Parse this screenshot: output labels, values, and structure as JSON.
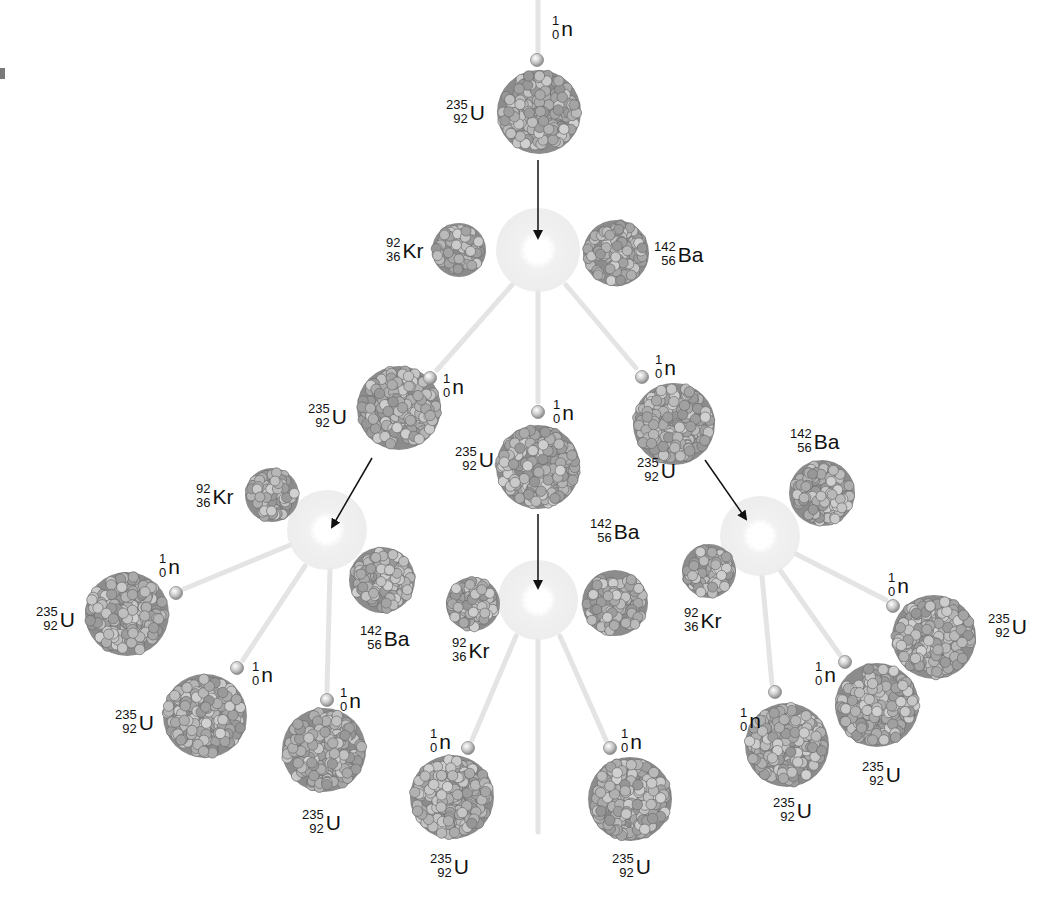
{
  "colors": {
    "background": "#ffffff",
    "nucleus_fill": "#9a9a9a",
    "nucleon_light": "#c8c8c8",
    "nucleon_dark": "#7d7d7d",
    "flash_glow": "#ececec",
    "neutron": "#cfcfcf",
    "arrow": "#111111",
    "trail": "#dcdcdc",
    "label_text": "#111111"
  },
  "species": {
    "U": {
      "symbol": "U",
      "mass": "235",
      "atomic": "92"
    },
    "Kr": {
      "symbol": "Kr",
      "mass": "92",
      "atomic": "36"
    },
    "Ba": {
      "symbol": "Ba",
      "mass": "142",
      "atomic": "56"
    },
    "n": {
      "symbol": "n",
      "mass": "1",
      "atomic": "0"
    }
  },
  "labels": [
    {
      "id": "n-top",
      "symbol": "n",
      "mass": "1",
      "atomic": "0",
      "x": 552,
      "y": 14
    },
    {
      "id": "u-top",
      "symbol": "U",
      "mass": "235",
      "atomic": "92",
      "x": 446,
      "y": 98
    },
    {
      "id": "kr-1",
      "symbol": "Kr",
      "mass": "92",
      "atomic": "36",
      "x": 386,
      "y": 236
    },
    {
      "id": "ba-1",
      "symbol": "Ba",
      "mass": "142",
      "atomic": "56",
      "x": 654,
      "y": 240
    },
    {
      "id": "n-l1",
      "symbol": "n",
      "mass": "1",
      "atomic": "0",
      "x": 443,
      "y": 372
    },
    {
      "id": "u-l1",
      "symbol": "U",
      "mass": "235",
      "atomic": "92",
      "x": 308,
      "y": 402
    },
    {
      "id": "n-c1",
      "symbol": "n",
      "mass": "1",
      "atomic": "0",
      "x": 553,
      "y": 398
    },
    {
      "id": "n-r1",
      "symbol": "n",
      "mass": "1",
      "atomic": "0",
      "x": 655,
      "y": 353
    },
    {
      "id": "u-c1",
      "symbol": "U",
      "mass": "235",
      "atomic": "92",
      "x": 455,
      "y": 445
    },
    {
      "id": "u-r1",
      "symbol": "U",
      "mass": "235",
      "atomic": "92",
      "x": 637,
      "y": 456
    },
    {
      "id": "ba-r2",
      "symbol": "Ba",
      "mass": "142",
      "atomic": "56",
      "x": 790,
      "y": 427
    },
    {
      "id": "kr-l2",
      "symbol": "Kr",
      "mass": "92",
      "atomic": "36",
      "x": 196,
      "y": 482
    },
    {
      "id": "ba-c2",
      "symbol": "Ba",
      "mass": "142",
      "atomic": "56",
      "x": 590,
      "y": 517
    },
    {
      "id": "n-l2a",
      "symbol": "n",
      "mass": "1",
      "atomic": "0",
      "x": 159,
      "y": 552
    },
    {
      "id": "u-l2a",
      "symbol": "U",
      "mass": "235",
      "atomic": "92",
      "x": 36,
      "y": 605
    },
    {
      "id": "n-r2a",
      "symbol": "n",
      "mass": "1",
      "atomic": "0",
      "x": 888,
      "y": 571
    },
    {
      "id": "kr-r2",
      "symbol": "Kr",
      "mass": "92",
      "atomic": "36",
      "x": 684,
      "y": 606
    },
    {
      "id": "u-r2a",
      "symbol": "U",
      "mass": "235",
      "atomic": "92",
      "x": 988,
      "y": 612
    },
    {
      "id": "ba-l2",
      "symbol": "Ba",
      "mass": "142",
      "atomic": "56",
      "x": 360,
      "y": 624
    },
    {
      "id": "kr-c2",
      "symbol": "Kr",
      "mass": "92",
      "atomic": "36",
      "x": 452,
      "y": 636
    },
    {
      "id": "n-l2b",
      "symbol": "n",
      "mass": "1",
      "atomic": "0",
      "x": 252,
      "y": 660
    },
    {
      "id": "n-r2b",
      "symbol": "n",
      "mass": "1",
      "atomic": "0",
      "x": 815,
      "y": 660
    },
    {
      "id": "u-l2b",
      "symbol": "U",
      "mass": "235",
      "atomic": "92",
      "x": 115,
      "y": 708
    },
    {
      "id": "n-l2c",
      "symbol": "n",
      "mass": "1",
      "atomic": "0",
      "x": 340,
      "y": 686
    },
    {
      "id": "n-r2c",
      "symbol": "n",
      "mass": "1",
      "atomic": "0",
      "x": 740,
      "y": 706
    },
    {
      "id": "n-c2a",
      "symbol": "n",
      "mass": "1",
      "atomic": "0",
      "x": 430,
      "y": 727
    },
    {
      "id": "n-c2b",
      "symbol": "n",
      "mass": "1",
      "atomic": "0",
      "x": 621,
      "y": 727
    },
    {
      "id": "u-r2b",
      "symbol": "U",
      "mass": "235",
      "atomic": "92",
      "x": 862,
      "y": 760
    },
    {
      "id": "u-l2c",
      "symbol": "U",
      "mass": "235",
      "atomic": "92",
      "x": 302,
      "y": 808
    },
    {
      "id": "u-r2c",
      "symbol": "U",
      "mass": "235",
      "atomic": "92",
      "x": 773,
      "y": 796
    },
    {
      "id": "u-c2a",
      "symbol": "U",
      "mass": "235",
      "atomic": "92",
      "x": 430,
      "y": 852
    },
    {
      "id": "u-c2b",
      "symbol": "U",
      "mass": "235",
      "atomic": "92",
      "x": 612,
      "y": 852
    }
  ],
  "nuclei": [
    {
      "id": "u-top",
      "species": "U",
      "cx": 539,
      "cy": 112,
      "r": 42
    },
    {
      "id": "kr-1",
      "species": "Kr",
      "cx": 459,
      "cy": 250,
      "r": 27
    },
    {
      "id": "ba-1",
      "species": "Ba",
      "cx": 616,
      "cy": 253,
      "r": 33
    },
    {
      "id": "u-l1",
      "species": "U",
      "cx": 399,
      "cy": 408,
      "r": 42
    },
    {
      "id": "u-c1",
      "species": "U",
      "cx": 538,
      "cy": 467,
      "r": 42
    },
    {
      "id": "u-r1",
      "species": "U",
      "cx": 674,
      "cy": 424,
      "r": 41
    },
    {
      "id": "kr-l2",
      "species": "Kr",
      "cx": 272,
      "cy": 495,
      "r": 27
    },
    {
      "id": "ba-l2",
      "species": "Ba",
      "cx": 382,
      "cy": 580,
      "r": 33
    },
    {
      "id": "u-l2a",
      "species": "U",
      "cx": 127,
      "cy": 614,
      "r": 42
    },
    {
      "id": "u-l2b",
      "species": "U",
      "cx": 205,
      "cy": 716,
      "r": 42
    },
    {
      "id": "u-l2c",
      "species": "U",
      "cx": 324,
      "cy": 750,
      "r": 42
    },
    {
      "id": "kr-c2",
      "species": "Kr",
      "cx": 473,
      "cy": 604,
      "r": 27
    },
    {
      "id": "ba-c2",
      "species": "Ba",
      "cx": 615,
      "cy": 603,
      "r": 33
    },
    {
      "id": "u-c2a",
      "species": "U",
      "cx": 452,
      "cy": 797,
      "r": 42
    },
    {
      "id": "u-c2b",
      "species": "U",
      "cx": 630,
      "cy": 799,
      "r": 42
    },
    {
      "id": "ba-r2",
      "species": "Ba",
      "cx": 822,
      "cy": 493,
      "r": 33
    },
    {
      "id": "kr-r2",
      "species": "Kr",
      "cx": 709,
      "cy": 571,
      "r": 27
    },
    {
      "id": "u-r2a",
      "species": "U",
      "cx": 934,
      "cy": 637,
      "r": 42
    },
    {
      "id": "u-r2b",
      "species": "U",
      "cx": 877,
      "cy": 705,
      "r": 42
    },
    {
      "id": "u-r2c",
      "species": "U",
      "cx": 787,
      "cy": 745,
      "r": 42
    }
  ],
  "neutrons": [
    {
      "id": "n-top",
      "cx": 537,
      "cy": 60
    },
    {
      "id": "n-l1",
      "cx": 430,
      "cy": 378
    },
    {
      "id": "n-c1",
      "cx": 538,
      "cy": 412
    },
    {
      "id": "n-r1",
      "cx": 642,
      "cy": 377
    },
    {
      "id": "n-l2a",
      "cx": 176,
      "cy": 593
    },
    {
      "id": "n-l2b",
      "cx": 237,
      "cy": 668
    },
    {
      "id": "n-l2c",
      "cx": 327,
      "cy": 700
    },
    {
      "id": "n-c2a",
      "cx": 468,
      "cy": 748
    },
    {
      "id": "n-c2b",
      "cx": 610,
      "cy": 748
    },
    {
      "id": "n-r2a",
      "cx": 893,
      "cy": 606
    },
    {
      "id": "n-r2b",
      "cx": 845,
      "cy": 662
    },
    {
      "id": "n-r2c",
      "cx": 775,
      "cy": 692
    }
  ],
  "flashes": [
    {
      "id": "flash-1",
      "cx": 538,
      "cy": 250,
      "r": 42
    },
    {
      "id": "flash-l2",
      "cx": 327,
      "cy": 530,
      "r": 40
    },
    {
      "id": "flash-c2",
      "cx": 538,
      "cy": 600,
      "r": 40
    },
    {
      "id": "flash-r2",
      "cx": 760,
      "cy": 536,
      "r": 40
    }
  ],
  "arrows": [
    {
      "id": "arrow-top",
      "x1": 538,
      "y1": 160,
      "x2": 538,
      "y2": 238
    },
    {
      "id": "arrow-l1",
      "x1": 372,
      "y1": 458,
      "x2": 332,
      "y2": 527
    },
    {
      "id": "arrow-c1",
      "x1": 538,
      "y1": 514,
      "x2": 538,
      "y2": 588
    },
    {
      "id": "arrow-r1",
      "x1": 705,
      "y1": 460,
      "x2": 746,
      "y2": 519
    }
  ],
  "trails": [
    {
      "x1": 538,
      "y1": 0,
      "x2": 538,
      "y2": 52
    },
    {
      "x1": 512,
      "y1": 285,
      "x2": 437,
      "y2": 370
    },
    {
      "x1": 538,
      "y1": 292,
      "x2": 538,
      "y2": 402
    },
    {
      "x1": 566,
      "y1": 285,
      "x2": 636,
      "y2": 368
    },
    {
      "x1": 290,
      "y1": 545,
      "x2": 184,
      "y2": 589
    },
    {
      "x1": 305,
      "y1": 566,
      "x2": 243,
      "y2": 660
    },
    {
      "x1": 330,
      "y1": 570,
      "x2": 327,
      "y2": 691
    },
    {
      "x1": 516,
      "y1": 636,
      "x2": 472,
      "y2": 740
    },
    {
      "x1": 538,
      "y1": 640,
      "x2": 538,
      "y2": 832
    },
    {
      "x1": 560,
      "y1": 636,
      "x2": 606,
      "y2": 740
    },
    {
      "x1": 796,
      "y1": 554,
      "x2": 886,
      "y2": 600
    },
    {
      "x1": 780,
      "y1": 570,
      "x2": 840,
      "y2": 655
    },
    {
      "x1": 762,
      "y1": 576,
      "x2": 772,
      "y2": 684
    }
  ]
}
